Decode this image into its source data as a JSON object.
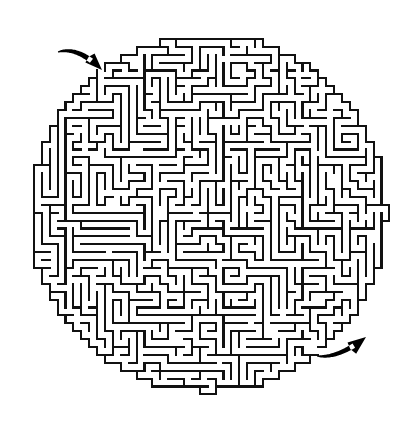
{
  "page": {
    "caption": "A round hedge-style maze drawn as black line walls on a white background, with a curved arrow marking the entrance at the upper left and a curved arrow marking the exit at the lower right.",
    "width": 414,
    "height": 430
  },
  "colors": {
    "background": "#ffffff",
    "wall": "#111111",
    "marker": "#000000"
  },
  "maze": {
    "shape": "circle",
    "center_x": 208,
    "center_y": 213,
    "radius": 182,
    "cell_size": 7.9,
    "wall_thickness": 2.1,
    "cols": 46,
    "rows": 46,
    "origin_x": 26,
    "origin_y": 31,
    "seed": 20240517,
    "braid_factor": 0.06,
    "long_corridor_bias": 0.34
  },
  "entrance": {
    "label": "entrance",
    "arrow_name": "entrance-arrow",
    "gap_x": 101,
    "gap_y": 69,
    "arrow": {
      "tail_x": 58,
      "tail_y": 52,
      "ctrl_x": 78,
      "ctrl_y": 46,
      "tip_x": 102,
      "tip_y": 70,
      "thickness": 7.0,
      "head_length": 17,
      "head_width": 13
    }
  },
  "exit": {
    "label": "exit",
    "arrow_name": "exit-arrow",
    "gap_x": 317,
    "gap_y": 353,
    "arrow": {
      "tail_x": 317,
      "tail_y": 356,
      "ctrl_x": 338,
      "ctrl_y": 359,
      "tip_x": 366,
      "tip_y": 337,
      "thickness": 6.6,
      "head_length": 18,
      "head_width": 14
    }
  }
}
